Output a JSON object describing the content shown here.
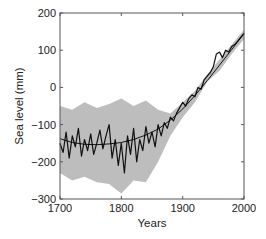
{
  "chart_data": {
    "type": "line",
    "title": "",
    "xlabel": "Years",
    "ylabel": "Sea level (mm)",
    "xlim": [
      1700,
      2000
    ],
    "ylim": [
      -300,
      200
    ],
    "xticks": [
      1700,
      1800,
      1900,
      2000
    ],
    "yticks": [
      -300,
      -200,
      -100,
      0,
      100,
      200
    ],
    "grid": false,
    "legend": null,
    "series": [
      {
        "name": "Reconstructed sea level (annual)",
        "style": "black line",
        "x": [
          1700,
          1705,
          1710,
          1715,
          1720,
          1725,
          1730,
          1735,
          1740,
          1745,
          1750,
          1755,
          1760,
          1765,
          1770,
          1775,
          1780,
          1785,
          1790,
          1795,
          1800,
          1805,
          1810,
          1815,
          1820,
          1825,
          1830,
          1835,
          1840,
          1845,
          1850,
          1855,
          1860,
          1865,
          1870,
          1875,
          1880,
          1885,
          1890,
          1895,
          1900,
          1905,
          1910,
          1915,
          1920,
          1925,
          1930,
          1935,
          1940,
          1945,
          1950,
          1955,
          1960,
          1965,
          1970,
          1975,
          1980,
          1985,
          1990,
          1995,
          2000
        ],
        "values": [
          -150,
          -175,
          -120,
          -190,
          -130,
          -160,
          -110,
          -185,
          -140,
          -170,
          -125,
          -180,
          -150,
          -115,
          -165,
          -130,
          -100,
          -190,
          -140,
          -210,
          -150,
          -230,
          -130,
          -180,
          -110,
          -200,
          -140,
          -170,
          -105,
          -150,
          -120,
          -160,
          -100,
          -130,
          -95,
          -110,
          -80,
          -90,
          -70,
          -55,
          -40,
          -50,
          -30,
          -20,
          -25,
          0,
          -5,
          20,
          30,
          40,
          55,
          90,
          95,
          80,
          100,
          95,
          110,
          115,
          125,
          135,
          145
        ]
      },
      {
        "name": "Smooth fit",
        "style": "thin black curve",
        "x": [
          1700,
          1720,
          1740,
          1760,
          1780,
          1800,
          1820,
          1840,
          1860,
          1880,
          1900,
          1920,
          1940,
          1960,
          1980,
          2000
        ],
        "values": [
          -138,
          -148,
          -153,
          -154,
          -152,
          -148,
          -140,
          -128,
          -112,
          -88,
          -58,
          -22,
          18,
          60,
          102,
          145
        ]
      },
      {
        "name": "Uncertainty band",
        "style": "grey shaded area",
        "x": [
          1700,
          1720,
          1740,
          1760,
          1780,
          1800,
          1820,
          1840,
          1860,
          1880,
          1900,
          1920,
          1940,
          1960,
          1980,
          2000
        ],
        "upper": [
          -50,
          -60,
          -40,
          -55,
          -45,
          -30,
          -50,
          -35,
          -60,
          -70,
          -40,
          -10,
          35,
          75,
          115,
          155
        ],
        "lower": [
          -230,
          -250,
          -240,
          -255,
          -260,
          -285,
          -250,
          -255,
          -200,
          -130,
          -80,
          -40,
          15,
          45,
          90,
          130
        ]
      }
    ]
  }
}
